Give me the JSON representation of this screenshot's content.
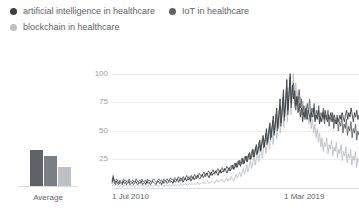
{
  "legend": {
    "items": [
      {
        "label": "artificial intelligence in healthcare",
        "color": "#3c4043"
      },
      {
        "label": "IoT in healthcare",
        "color": "#5f6368"
      },
      {
        "label": "blockchain in healthcare",
        "color": "#bdc1c6"
      }
    ]
  },
  "average_panel": {
    "label": "Average",
    "values": [
      30,
      25,
      16
    ],
    "colors": [
      "#5f6368",
      "#7a7f85",
      "#bdc1c6"
    ]
  },
  "chart_data": {
    "type": "line",
    "title": "",
    "xlabel": "",
    "ylabel": "",
    "ylim": [
      0,
      105
    ],
    "grid": true,
    "legend_position": "top-left",
    "yticks": [
      25,
      50,
      75,
      100
    ],
    "xticks": [
      "1 Jul 2010",
      "1 Mar 2019"
    ],
    "x_start_label": "1 Jul 2010",
    "x_end_label": "1 Mar 2019",
    "series": [
      {
        "name": "artificial intelligence in healthcare",
        "color": "#3c4043",
        "values": [
          4,
          9,
          5,
          3,
          6,
          4,
          3,
          5,
          4,
          3,
          6,
          4,
          5,
          3,
          4,
          6,
          3,
          4,
          5,
          3,
          4,
          6,
          4,
          3,
          5,
          4,
          6,
          3,
          4,
          5,
          3,
          6,
          4,
          5,
          3,
          4,
          6,
          5,
          4,
          3,
          5,
          6,
          4,
          5,
          3,
          6,
          4,
          5,
          6,
          4,
          5,
          7,
          5,
          6,
          4,
          7,
          5,
          6,
          8,
          5,
          7,
          6,
          8,
          5,
          7,
          9,
          6,
          8,
          7,
          9,
          6,
          8,
          10,
          7,
          9,
          8,
          11,
          9,
          8,
          10,
          12,
          9,
          11,
          10,
          13,
          11,
          9,
          12,
          14,
          11,
          13,
          12,
          15,
          13,
          11,
          14,
          16,
          13,
          15,
          14,
          17,
          15,
          13,
          16,
          18,
          15,
          17,
          20,
          16,
          19,
          22,
          18,
          21,
          24,
          19,
          23,
          26,
          21,
          25,
          28,
          23,
          27,
          31,
          25,
          29,
          34,
          27,
          32,
          38,
          30,
          35,
          42,
          33,
          39,
          46,
          36,
          43,
          52,
          40,
          48,
          57,
          44,
          53,
          63,
          48,
          58,
          70,
          52,
          64,
          78,
          57,
          70,
          86,
          62,
          77,
          95,
          68,
          84,
          100,
          74,
          90,
          78,
          85,
          72,
          80,
          66,
          74,
          62,
          70,
          58,
          66,
          62,
          70,
          60,
          68,
          64,
          58,
          66,
          62,
          70,
          58,
          64,
          60,
          68,
          56,
          62,
          58,
          66,
          60,
          68,
          62,
          58,
          64,
          60,
          66,
          62,
          58,
          64,
          60,
          56,
          62,
          58,
          64,
          60,
          66,
          62,
          58,
          64,
          68,
          60,
          66,
          62,
          70,
          64,
          58,
          66,
          62,
          68,
          60,
          64
        ]
      },
      {
        "name": "IoT in healthcare",
        "color": "#5f6368",
        "values": [
          6,
          11,
          7,
          5,
          8,
          6,
          4,
          7,
          5,
          4,
          8,
          6,
          7,
          5,
          6,
          8,
          5,
          6,
          7,
          5,
          6,
          8,
          6,
          5,
          7,
          6,
          8,
          5,
          6,
          7,
          5,
          8,
          6,
          7,
          5,
          6,
          8,
          7,
          6,
          5,
          7,
          8,
          6,
          7,
          5,
          8,
          6,
          7,
          8,
          6,
          7,
          9,
          7,
          8,
          6,
          9,
          7,
          8,
          10,
          7,
          9,
          8,
          10,
          7,
          9,
          11,
          8,
          10,
          9,
          11,
          8,
          10,
          12,
          9,
          11,
          10,
          13,
          11,
          10,
          12,
          14,
          11,
          13,
          12,
          15,
          13,
          11,
          14,
          16,
          13,
          15,
          14,
          17,
          15,
          13,
          16,
          18,
          15,
          17,
          16,
          19,
          17,
          15,
          18,
          20,
          17,
          19,
          22,
          18,
          21,
          24,
          20,
          23,
          26,
          21,
          25,
          28,
          23,
          27,
          30,
          25,
          29,
          33,
          27,
          31,
          36,
          29,
          34,
          40,
          32,
          37,
          44,
          35,
          41,
          48,
          38,
          45,
          54,
          42,
          50,
          59,
          46,
          55,
          65,
          50,
          60,
          72,
          54,
          66,
          80,
          59,
          72,
          88,
          64,
          79,
          97,
          70,
          86,
          92,
          76,
          68,
          80,
          74,
          86,
          70,
          78,
          64,
          72,
          60,
          68,
          74,
          66,
          78,
          62,
          70,
          66,
          74,
          60,
          68,
          64,
          72,
          58,
          66,
          62,
          70,
          56,
          64,
          60,
          68,
          54,
          62,
          58,
          66,
          52,
          60,
          56,
          64,
          50,
          58,
          54,
          62,
          48,
          56,
          52,
          60,
          46,
          54,
          50,
          58,
          44,
          52,
          48,
          56,
          42,
          50,
          46
        ]
      },
      {
        "name": "blockchain in healthcare",
        "color": "#bdc1c6",
        "values": [
          2,
          3,
          2,
          2,
          3,
          2,
          1,
          2,
          2,
          1,
          3,
          2,
          2,
          1,
          2,
          3,
          1,
          2,
          2,
          1,
          2,
          3,
          2,
          1,
          2,
          2,
          3,
          1,
          2,
          2,
          1,
          3,
          2,
          2,
          1,
          2,
          3,
          2,
          2,
          1,
          2,
          3,
          2,
          2,
          1,
          3,
          2,
          2,
          3,
          2,
          2,
          3,
          2,
          3,
          2,
          3,
          2,
          3,
          4,
          2,
          3,
          3,
          4,
          2,
          3,
          4,
          3,
          4,
          3,
          4,
          3,
          4,
          5,
          3,
          4,
          4,
          5,
          4,
          4,
          5,
          6,
          4,
          5,
          5,
          6,
          5,
          4,
          6,
          7,
          5,
          6,
          6,
          8,
          6,
          5,
          7,
          9,
          6,
          8,
          7,
          10,
          8,
          6,
          9,
          12,
          9,
          11,
          14,
          10,
          13,
          17,
          12,
          16,
          20,
          14,
          19,
          24,
          17,
          22,
          28,
          20,
          26,
          32,
          23,
          30,
          37,
          26,
          34,
          42,
          30,
          39,
          48,
          34,
          44,
          54,
          38,
          50,
          61,
          43,
          57,
          68,
          48,
          64,
          76,
          53,
          71,
          84,
          58,
          78,
          92,
          64,
          85,
          100,
          70,
          92,
          78,
          86,
          72,
          80,
          68,
          76,
          64,
          72,
          60,
          68,
          56,
          64,
          52,
          60,
          48,
          56,
          44,
          52,
          40,
          48,
          36,
          44,
          32,
          40,
          36,
          44,
          30,
          38,
          34,
          42,
          28,
          36,
          32,
          40,
          26,
          34,
          30,
          38,
          24,
          32,
          28,
          36,
          22,
          30,
          26,
          34,
          20,
          28,
          24,
          32,
          18,
          26,
          22
        ]
      }
    ]
  }
}
